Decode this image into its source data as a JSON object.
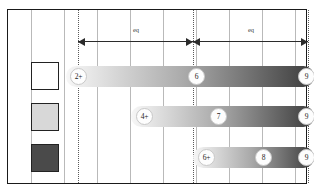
{
  "figure": {
    "width": 314,
    "height": 195,
    "background": "#ffffff",
    "frame_color": "#1a1a1a",
    "grid_color": "#b9b9b9",
    "dotted_color": "#5a5a5a"
  },
  "legend": {
    "swatches": [
      {
        "name": "legend-swatch-light",
        "fill": "#ffffff",
        "x": 31,
        "y": 62
      },
      {
        "name": "legend-swatch-medium",
        "fill": "#d8d8d8",
        "x": 31,
        "y": 103
      },
      {
        "name": "legend-swatch-dark",
        "fill": "#4a4a4a",
        "x": 31,
        "y": 144
      }
    ]
  },
  "annotations": {
    "arrows": [
      {
        "label": "eq",
        "x_start": 78,
        "x_end": 193,
        "y": 41,
        "label_x": 136,
        "label_y": 26
      },
      {
        "label": "eq",
        "x_start": 193,
        "x_end": 308,
        "y": 41,
        "label_x": 251,
        "label_y": 26
      }
    ],
    "reference_lines": [
      78,
      193,
      308
    ]
  },
  "gridlines": [
    31,
    64,
    97,
    130,
    163,
    196,
    229,
    262,
    295
  ],
  "chart_data": {
    "type": "bar",
    "title": "",
    "subtitle": "",
    "xlabel": "",
    "ylabel": "",
    "grid": true,
    "legend_position": "left",
    "orientation": "horizontal",
    "gradient": {
      "from": "#f7f7f7",
      "mid": "#a9a9a9",
      "to": "#3b3b3b"
    },
    "xlim": [
      0,
      314
    ],
    "series": [
      {
        "name": "series-1",
        "y": 66,
        "x_start": 66,
        "x_end": 314,
        "markers": [
          {
            "label": "2+",
            "x": 70
          },
          {
            "label": "6",
            "x": 188
          },
          {
            "label": "9",
            "x": 298
          }
        ]
      },
      {
        "name": "series-2",
        "y": 106,
        "x_start": 131,
        "x_end": 314,
        "markers": [
          {
            "label": "4+",
            "x": 136
          },
          {
            "label": "7",
            "x": 210
          },
          {
            "label": "9",
            "x": 298
          }
        ]
      },
      {
        "name": "series-3",
        "y": 147,
        "x_start": 193,
        "x_end": 314,
        "markers": [
          {
            "label": "6+",
            "x": 198
          },
          {
            "label": "8",
            "x": 255
          },
          {
            "label": "9",
            "x": 298
          }
        ]
      }
    ]
  }
}
